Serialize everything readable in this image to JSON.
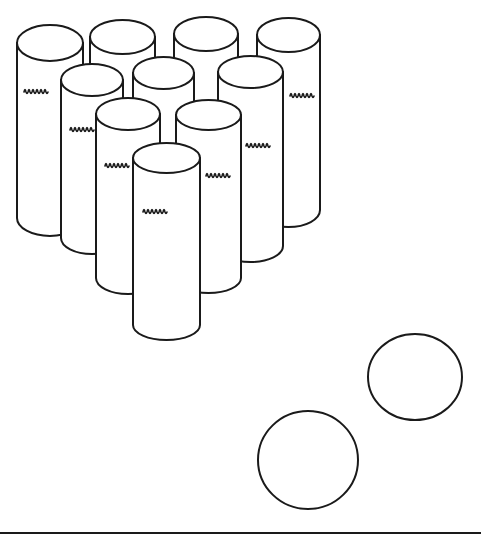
{
  "scene": {
    "description": "Line drawing of ten bowling pins made from cardboard tubes arranged in a triangle, with two balls",
    "background": "#ffffff",
    "stroke_color": "#1a1a1a",
    "pins": [
      {
        "id": "back-1",
        "x": 17,
        "w": 66,
        "top": 43,
        "ry": 18,
        "bottom": 218,
        "label": true,
        "lx": 24,
        "ly": 92
      },
      {
        "id": "back-2",
        "x": 90,
        "w": 65,
        "top": 37,
        "ry": 17,
        "bottom": 150,
        "label": false
      },
      {
        "id": "back-3",
        "x": 174,
        "w": 64,
        "top": 34,
        "ry": 17,
        "bottom": 150,
        "label": false
      },
      {
        "id": "back-4",
        "x": 257,
        "w": 63,
        "top": 35,
        "ry": 17,
        "bottom": 210,
        "label": true,
        "lx": 290,
        "ly": 96
      },
      {
        "id": "row2-1",
        "x": 61,
        "w": 62,
        "top": 80,
        "ry": 16,
        "bottom": 238,
        "label": true,
        "lx": 70,
        "ly": 130
      },
      {
        "id": "row2-2",
        "x": 133,
        "w": 61,
        "top": 73,
        "ry": 16,
        "bottom": 170,
        "label": false
      },
      {
        "id": "row2-3",
        "x": 218,
        "w": 65,
        "top": 72,
        "ry": 16,
        "bottom": 246,
        "label": true,
        "lx": 246,
        "ly": 146
      },
      {
        "id": "row3-1",
        "x": 96,
        "w": 64,
        "top": 114,
        "ry": 16,
        "bottom": 278,
        "label": true,
        "lx": 105,
        "ly": 166
      },
      {
        "id": "row3-2",
        "x": 176,
        "w": 65,
        "top": 115,
        "ry": 15,
        "bottom": 278,
        "label": true,
        "lx": 206,
        "ly": 176
      },
      {
        "id": "front",
        "x": 133,
        "w": 67,
        "top": 158,
        "ry": 15,
        "bottom": 325,
        "label": true,
        "lx": 143,
        "ly": 212
      }
    ],
    "balls": [
      {
        "id": "ball-near",
        "cx": 308,
        "cy": 460,
        "rx": 50,
        "ry": 49
      },
      {
        "id": "ball-far",
        "cx": 415,
        "cy": 377,
        "rx": 47,
        "ry": 43
      }
    ],
    "ground_line": {
      "y": 533,
      "x1": 0,
      "x2": 481
    }
  }
}
